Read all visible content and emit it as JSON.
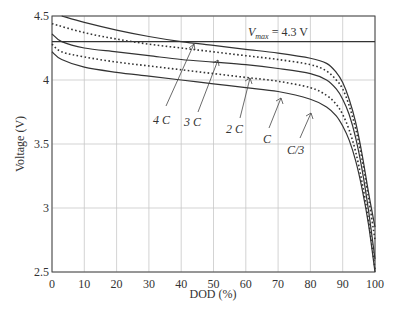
{
  "chart_data": {
    "type": "line",
    "title": "",
    "xlabel": "DOD (%)",
    "ylabel": "Voltage (V)",
    "xlim": [
      0,
      100
    ],
    "ylim": [
      2.5,
      4.5
    ],
    "grid": true,
    "x_ticks": [
      "0",
      "10",
      "20",
      "30",
      "40",
      "50",
      "60",
      "70",
      "80",
      "90",
      "100"
    ],
    "y_ticks": [
      "4.5",
      "4",
      "3.5",
      "3",
      "2.5"
    ],
    "reference_line": {
      "label": "V_max = 4.3 V",
      "value": 4.3
    },
    "series": [
      {
        "name": "4C",
        "style": "solid",
        "x": [
          3,
          10,
          20,
          30,
          40,
          50,
          60,
          70,
          80,
          85,
          88,
          90,
          92,
          94,
          96,
          98,
          100
        ],
        "values": [
          4.5,
          4.45,
          4.39,
          4.34,
          4.3,
          4.27,
          4.24,
          4.21,
          4.17,
          4.13,
          4.06,
          3.98,
          3.85,
          3.67,
          3.42,
          3.12,
          2.85
        ]
      },
      {
        "name": "3C",
        "style": "dotted",
        "x": [
          0,
          10,
          20,
          30,
          40,
          50,
          60,
          70,
          80,
          85,
          88,
          90,
          92,
          94,
          96,
          98,
          100
        ],
        "values": [
          4.44,
          4.37,
          4.32,
          4.28,
          4.25,
          4.22,
          4.19,
          4.16,
          4.12,
          4.07,
          4.0,
          3.93,
          3.8,
          3.62,
          3.38,
          3.08,
          2.75
        ]
      },
      {
        "name": "2C",
        "style": "solid",
        "x": [
          0,
          3,
          10,
          20,
          30,
          40,
          50,
          60,
          70,
          80,
          85,
          88,
          90,
          92,
          94,
          96,
          98,
          100
        ],
        "values": [
          4.36,
          4.3,
          4.25,
          4.22,
          4.19,
          4.16,
          4.14,
          4.12,
          4.09,
          4.05,
          4.0,
          3.93,
          3.85,
          3.73,
          3.55,
          3.3,
          2.98,
          2.6
        ]
      },
      {
        "name": "C",
        "style": "dotted",
        "x": [
          0,
          3,
          10,
          20,
          30,
          40,
          50,
          60,
          70,
          80,
          85,
          88,
          90,
          92,
          94,
          96,
          98,
          100
        ],
        "values": [
          4.28,
          4.22,
          4.18,
          4.14,
          4.11,
          4.08,
          4.05,
          4.02,
          3.99,
          3.94,
          3.88,
          3.81,
          3.73,
          3.61,
          3.44,
          3.2,
          2.9,
          2.52
        ]
      },
      {
        "name": "C/3",
        "style": "solid",
        "x": [
          0,
          3,
          10,
          20,
          30,
          40,
          50,
          60,
          70,
          80,
          85,
          88,
          90,
          92,
          94,
          96,
          98,
          100
        ],
        "values": [
          4.22,
          4.16,
          4.1,
          4.06,
          4.03,
          4.0,
          3.97,
          3.94,
          3.91,
          3.85,
          3.79,
          3.72,
          3.64,
          3.53,
          3.37,
          3.15,
          2.87,
          2.5
        ]
      }
    ],
    "annotations": [
      {
        "text": "4C",
        "points_to": "4C",
        "at_x": 40
      },
      {
        "text": "3C",
        "points_to": "3C",
        "at_x": 48
      },
      {
        "text": "2C",
        "points_to": "2C",
        "at_x": 58
      },
      {
        "text": "C",
        "points_to": "C",
        "at_x": 70
      },
      {
        "text": "C/3",
        "points_to": "C/3",
        "at_x": 80
      }
    ]
  },
  "labels": {
    "xlabel": "DOD (%)",
    "ylabel": "Voltage (V)",
    "vmax_v": "V",
    "vmax_sub": "max",
    "vmax_rest": " = 4.3 V",
    "annot_4c": "4 C",
    "annot_3c": "3 C",
    "annot_2c": "2 C",
    "annot_c": "C",
    "annot_c3": "C/3"
  }
}
